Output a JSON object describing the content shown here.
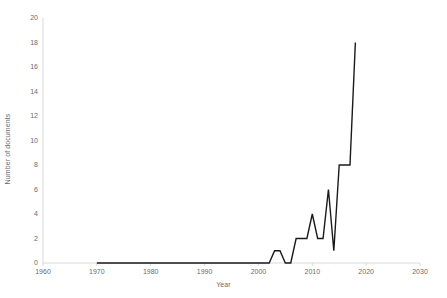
{
  "chart_data": {
    "type": "line",
    "title": "",
    "xlabel": "Year",
    "ylabel": "Number of documents",
    "xlim": [
      1960,
      2030
    ],
    "ylim": [
      0,
      20
    ],
    "xticks": [
      1960,
      1970,
      1980,
      1990,
      2000,
      2010,
      2020,
      2030
    ],
    "yticks": [
      0,
      2,
      4,
      6,
      8,
      10,
      12,
      14,
      16,
      18,
      20
    ],
    "grid": false,
    "legend": null,
    "line_color": "#1a1a1a",
    "series": [
      {
        "name": "Number of documents",
        "x": [
          1970,
          1971,
          1972,
          1973,
          1974,
          1975,
          1976,
          1977,
          1978,
          1979,
          1980,
          1981,
          1982,
          1983,
          1984,
          1985,
          1986,
          1987,
          1988,
          1989,
          1990,
          1991,
          1992,
          1993,
          1994,
          1995,
          1996,
          1997,
          1998,
          1999,
          2000,
          2001,
          2002,
          2003,
          2004,
          2005,
          2006,
          2007,
          2008,
          2009,
          2010,
          2011,
          2012,
          2013,
          2014,
          2015,
          2016,
          2017,
          2018
        ],
        "values": [
          0,
          0,
          0,
          0,
          0,
          0,
          0,
          0,
          0,
          0,
          0,
          0,
          0,
          0,
          0,
          0,
          0,
          0,
          0,
          0,
          0,
          0,
          0,
          0,
          0,
          0,
          0,
          0,
          0,
          0,
          0,
          0,
          0,
          1,
          1,
          0,
          0,
          2,
          2,
          2,
          4,
          2,
          2,
          6,
          1,
          8,
          8,
          8,
          18
        ]
      }
    ]
  },
  "axis": {
    "x_tick_labels": [
      "1960",
      "1970",
      "1980",
      "1990",
      "2000",
      "2010",
      "2020",
      "2030"
    ],
    "y_tick_labels": [
      "0",
      "2",
      "4",
      "6",
      "8",
      "10",
      "12",
      "14",
      "16",
      "18",
      "20"
    ],
    "x_title": "Year",
    "y_title": "Number of documents"
  }
}
